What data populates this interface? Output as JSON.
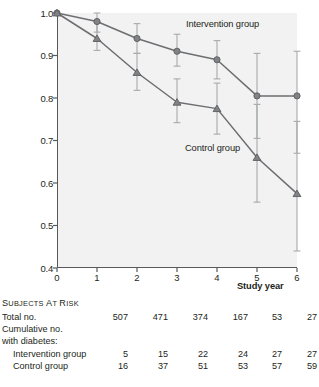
{
  "chart_data": {
    "type": "line",
    "title": "",
    "xlabel": "Study year",
    "ylabel": "Cumulative probability of remaining free of diabetes",
    "x": [
      0,
      1,
      2,
      3,
      4,
      5,
      6
    ],
    "xlim": [
      0,
      6
    ],
    "ylim": [
      0.4,
      1.0
    ],
    "xticks": [
      "0",
      "1",
      "2",
      "3",
      "4",
      "5",
      "6"
    ],
    "yticks": [
      "1.0",
      "0.9",
      "0.8",
      "0.7",
      "0.6",
      "0.5",
      "0.4"
    ],
    "grid": false,
    "legend_position": "inline-annotation",
    "series": [
      {
        "name": "Intervention group",
        "marker": "circle",
        "values": [
          1.0,
          0.98,
          0.94,
          0.91,
          0.89,
          0.805,
          0.805
        ],
        "ci_lower": [
          1.0,
          0.955,
          0.905,
          0.875,
          0.845,
          0.705,
          0.67
        ],
        "ci_upper": [
          1.0,
          1.0,
          0.975,
          0.95,
          0.935,
          0.905,
          0.91
        ]
      },
      {
        "name": "Control group",
        "marker": "triangle",
        "values": [
          1.0,
          0.94,
          0.86,
          0.79,
          0.775,
          0.66,
          0.575
        ],
        "ci_lower": [
          1.0,
          0.912,
          0.818,
          0.742,
          0.715,
          0.555,
          0.44
        ],
        "ci_upper": [
          1.0,
          0.978,
          0.905,
          0.845,
          0.835,
          0.785,
          0.745
        ]
      }
    ],
    "annotations": [
      {
        "text": "Intervention group",
        "x": 3.2,
        "y": 0.975
      },
      {
        "text": "Control group",
        "x": 3.2,
        "y": 0.69
      }
    ],
    "colors": {
      "series_line": "#6d6e71",
      "marker_fill": "#808285",
      "error_bar": "#a7a9ac",
      "axis": "#58595b",
      "plot_background": "#f2f2f2",
      "text": "#231f20"
    }
  },
  "risk_table": {
    "heading": "SUBJECTS AT RISK",
    "rows": [
      {
        "label": "Total no.",
        "indent": false,
        "values": [
          "507",
          "471",
          "374",
          "167",
          "53",
          "27"
        ]
      },
      {
        "label": "Cumulative no.",
        "indent": false,
        "values": [
          "",
          "",
          "",
          "",
          "",
          ""
        ]
      },
      {
        "label": "with diabetes:",
        "indent": false,
        "values": [
          "",
          "",
          "",
          "",
          "",
          ""
        ]
      },
      {
        "label": "Intervention group",
        "indent": true,
        "values": [
          "5",
          "15",
          "22",
          "24",
          "27",
          "27"
        ]
      },
      {
        "label": "Control group",
        "indent": true,
        "values": [
          "16",
          "37",
          "51",
          "53",
          "57",
          "59"
        ]
      }
    ]
  }
}
